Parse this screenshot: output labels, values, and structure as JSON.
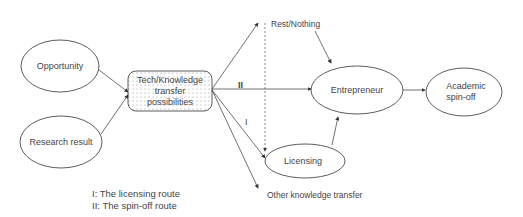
{
  "nodes": {
    "opportunity": "Opportunity",
    "research_result": "Research result",
    "tech_transfer": [
      "Tech/Knowledge",
      "transfer",
      "possibilities"
    ],
    "rest_nothing": "Rest/Nothing",
    "entrepreneur": "Entrepreneur",
    "academic_spinoff": [
      "Academic",
      "spin-off"
    ],
    "licensing": "Licensing",
    "other_transfer": "Other knowledge transfer"
  },
  "route_labels": {
    "route_ii": "II",
    "route_i": "I"
  },
  "legend": [
    "I: The licensing route",
    "II: The spin-off route"
  ]
}
